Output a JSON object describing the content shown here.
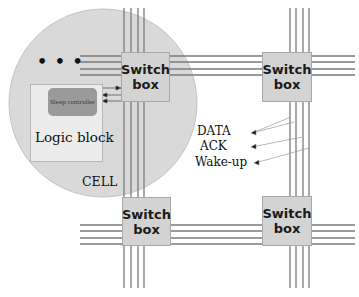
{
  "diagram": {
    "cell_label": "CELL",
    "logic_block_label": "Logic block",
    "sleep_controller_label": "Sleep controller",
    "ellipsis": "• • •",
    "switch_boxes": [
      {
        "id": "top-left",
        "line1": "Switch",
        "line2": "box"
      },
      {
        "id": "top-right",
        "line1": "Switch",
        "line2": "box"
      },
      {
        "id": "bottom-left",
        "line1": "Switch",
        "line2": "box"
      },
      {
        "id": "bottom-right",
        "line1": "Switch",
        "line2": "box"
      }
    ],
    "signals": [
      "DATA",
      "ACK",
      "Wake-up"
    ],
    "colors": {
      "cell_fill": "#d9d9d9",
      "switch_box_fill": "#d3d3d3",
      "logic_block_fill": "#ececec",
      "sleep_controller_fill": "#9a9a9a",
      "wire": "#7a7a7a"
    }
  }
}
